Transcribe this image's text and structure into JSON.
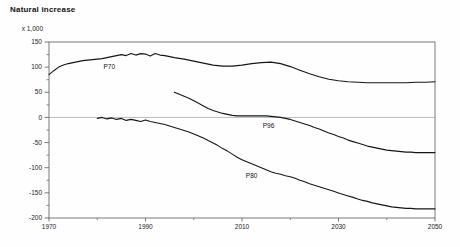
{
  "chart_data": {
    "type": "line",
    "title": "Natural increase",
    "unit_label": "x 1,000",
    "xlabel": "",
    "ylabel": "x 1,000",
    "xlim": [
      1970,
      2050
    ],
    "ylim": [
      -200,
      150
    ],
    "x_ticks": [
      1970,
      1990,
      2010,
      2030,
      2050
    ],
    "x_minor_step": 10,
    "y_ticks": [
      150,
      100,
      50,
      0,
      -50,
      -100,
      -150,
      -200
    ],
    "y_minor_step": 25,
    "grid": false,
    "zero_line": true,
    "legend_position": "inline-labels",
    "colors": {
      "line": "#161616",
      "frame": "#5a5a5a",
      "zero_line": "#a8a8a8",
      "background": "#fefefe"
    },
    "series": [
      {
        "name": "P70",
        "label_at": [
          1981.3,
          96
        ],
        "points": [
          [
            1970,
            85
          ],
          [
            1971,
            93
          ],
          [
            1972,
            100
          ],
          [
            1973,
            104
          ],
          [
            1974,
            107
          ],
          [
            1975,
            109
          ],
          [
            1976,
            111
          ],
          [
            1977,
            113
          ],
          [
            1978,
            114
          ],
          [
            1979,
            115
          ],
          [
            1980,
            116
          ],
          [
            1981,
            117
          ],
          [
            1982,
            119
          ],
          [
            1983,
            121
          ],
          [
            1984,
            123
          ],
          [
            1985,
            125
          ],
          [
            1986,
            123
          ],
          [
            1987,
            127
          ],
          [
            1988,
            124
          ],
          [
            1989,
            127
          ],
          [
            1990,
            126
          ],
          [
            1991,
            122
          ],
          [
            1992,
            127
          ],
          [
            1993,
            124
          ],
          [
            1994,
            123
          ],
          [
            1995,
            121
          ],
          [
            1996,
            119
          ],
          [
            1998,
            116
          ],
          [
            2000,
            112
          ],
          [
            2002,
            108
          ],
          [
            2004,
            104
          ],
          [
            2006,
            102
          ],
          [
            2008,
            102
          ],
          [
            2010,
            104
          ],
          [
            2012,
            107
          ],
          [
            2014,
            109
          ],
          [
            2016,
            110
          ],
          [
            2018,
            107
          ],
          [
            2020,
            101
          ],
          [
            2022,
            94
          ],
          [
            2024,
            87
          ],
          [
            2026,
            81
          ],
          [
            2028,
            76
          ],
          [
            2030,
            73
          ],
          [
            2032,
            71
          ],
          [
            2034,
            70
          ],
          [
            2036,
            69
          ],
          [
            2038,
            69
          ],
          [
            2040,
            69
          ],
          [
            2042,
            69
          ],
          [
            2044,
            69
          ],
          [
            2046,
            70
          ],
          [
            2048,
            70
          ],
          [
            2050,
            71
          ]
        ]
      },
      {
        "name": "P96",
        "label_at": [
          2014.3,
          -22
        ],
        "points": [
          [
            1996,
            50
          ],
          [
            1997,
            46
          ],
          [
            1998,
            42
          ],
          [
            1999,
            38
          ],
          [
            2000,
            33
          ],
          [
            2001,
            28
          ],
          [
            2002,
            23
          ],
          [
            2003,
            18
          ],
          [
            2004,
            14
          ],
          [
            2005,
            11
          ],
          [
            2006,
            8
          ],
          [
            2007,
            6
          ],
          [
            2008,
            4
          ],
          [
            2009,
            3
          ],
          [
            2010,
            3
          ],
          [
            2011,
            3
          ],
          [
            2012,
            3
          ],
          [
            2013,
            3
          ],
          [
            2014,
            3
          ],
          [
            2015,
            3
          ],
          [
            2016,
            2
          ],
          [
            2017,
            1
          ],
          [
            2018,
            0
          ],
          [
            2019,
            -2
          ],
          [
            2020,
            -4
          ],
          [
            2021,
            -7
          ],
          [
            2022,
            -10
          ],
          [
            2023,
            -13
          ],
          [
            2024,
            -16
          ],
          [
            2025,
            -20
          ],
          [
            2026,
            -23
          ],
          [
            2027,
            -27
          ],
          [
            2028,
            -31
          ],
          [
            2029,
            -34
          ],
          [
            2030,
            -38
          ],
          [
            2031,
            -41
          ],
          [
            2032,
            -45
          ],
          [
            2033,
            -48
          ],
          [
            2034,
            -51
          ],
          [
            2035,
            -54
          ],
          [
            2036,
            -57
          ],
          [
            2037,
            -59
          ],
          [
            2038,
            -61
          ],
          [
            2039,
            -63
          ],
          [
            2040,
            -65
          ],
          [
            2041,
            -66
          ],
          [
            2042,
            -67
          ],
          [
            2043,
            -68
          ],
          [
            2044,
            -69
          ],
          [
            2045,
            -69
          ],
          [
            2046,
            -70
          ],
          [
            2047,
            -70
          ],
          [
            2048,
            -70
          ],
          [
            2049,
            -70
          ],
          [
            2050,
            -70
          ]
        ]
      },
      {
        "name": "P80",
        "label_at": [
          2010.8,
          -120
        ],
        "points": [
          [
            1980,
            -2
          ],
          [
            1981,
            0
          ],
          [
            1982,
            -3
          ],
          [
            1983,
            -1
          ],
          [
            1984,
            -4
          ],
          [
            1985,
            -2
          ],
          [
            1986,
            -6
          ],
          [
            1987,
            -4
          ],
          [
            1988,
            -6
          ],
          [
            1989,
            -8
          ],
          [
            1990,
            -5
          ],
          [
            1991,
            -8
          ],
          [
            1992,
            -10
          ],
          [
            1993,
            -12
          ],
          [
            1994,
            -14
          ],
          [
            1995,
            -17
          ],
          [
            1996,
            -20
          ],
          [
            1997,
            -23
          ],
          [
            1998,
            -26
          ],
          [
            1999,
            -29
          ],
          [
            2000,
            -33
          ],
          [
            2001,
            -37
          ],
          [
            2002,
            -41
          ],
          [
            2003,
            -46
          ],
          [
            2004,
            -51
          ],
          [
            2005,
            -56
          ],
          [
            2006,
            -62
          ],
          [
            2007,
            -67
          ],
          [
            2008,
            -73
          ],
          [
            2009,
            -79
          ],
          [
            2010,
            -84
          ],
          [
            2011,
            -88
          ],
          [
            2012,
            -92
          ],
          [
            2013,
            -96
          ],
          [
            2014,
            -100
          ],
          [
            2015,
            -104
          ],
          [
            2016,
            -108
          ],
          [
            2017,
            -111
          ],
          [
            2018,
            -113
          ],
          [
            2019,
            -116
          ],
          [
            2020,
            -118
          ],
          [
            2021,
            -121
          ],
          [
            2022,
            -125
          ],
          [
            2023,
            -128
          ],
          [
            2024,
            -132
          ],
          [
            2025,
            -135
          ],
          [
            2026,
            -138
          ],
          [
            2027,
            -141
          ],
          [
            2028,
            -144
          ],
          [
            2029,
            -147
          ],
          [
            2030,
            -150
          ],
          [
            2031,
            -153
          ],
          [
            2032,
            -156
          ],
          [
            2033,
            -159
          ],
          [
            2034,
            -162
          ],
          [
            2035,
            -165
          ],
          [
            2036,
            -167
          ],
          [
            2037,
            -170
          ],
          [
            2038,
            -172
          ],
          [
            2039,
            -174
          ],
          [
            2040,
            -176
          ],
          [
            2041,
            -178
          ],
          [
            2042,
            -179
          ],
          [
            2043,
            -180
          ],
          [
            2044,
            -181
          ],
          [
            2045,
            -181
          ],
          [
            2046,
            -182
          ],
          [
            2047,
            -182
          ],
          [
            2048,
            -182
          ],
          [
            2049,
            -182
          ],
          [
            2050,
            -182
          ]
        ]
      }
    ]
  }
}
